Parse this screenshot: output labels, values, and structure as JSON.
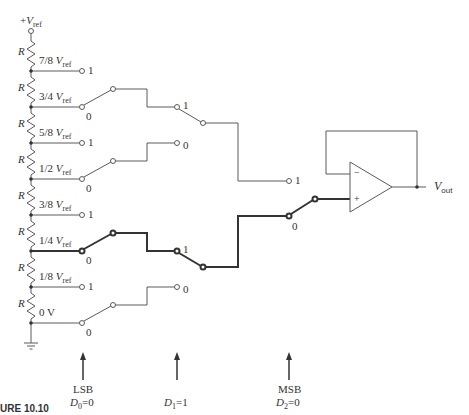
{
  "figure": {
    "caption": "URE 10.10",
    "supply_label": {
      "prefix": "+",
      "symbol": "V",
      "sub": "ref"
    },
    "resistor_label": "R",
    "taps": [
      {
        "fraction": "7/8",
        "symbol": "V",
        "sub": "ref",
        "switch_input": "1"
      },
      {
        "fraction": "3/4",
        "symbol": "V",
        "sub": "ref",
        "switch_input": "0"
      },
      {
        "fraction": "5/8",
        "symbol": "V",
        "sub": "ref",
        "switch_input": "1"
      },
      {
        "fraction": "1/2",
        "symbol": "V",
        "sub": "ref",
        "switch_input": "0"
      },
      {
        "fraction": "3/8",
        "symbol": "V",
        "sub": "ref",
        "switch_input": "1"
      },
      {
        "fraction": "1/4",
        "symbol": "V",
        "sub": "ref",
        "switch_input": "0"
      },
      {
        "fraction": "1/8",
        "symbol": "V",
        "sub": "ref",
        "switch_input": "1"
      },
      {
        "fraction": "0 V",
        "symbol": "",
        "sub": "",
        "switch_input": "0"
      }
    ],
    "stage2_inputs": [
      "1",
      "0",
      "1",
      "0"
    ],
    "stage3_inputs": [
      "1",
      "0"
    ],
    "opamp": {
      "minus": "−",
      "plus": "+"
    },
    "output_label": {
      "symbol": "V",
      "sub": "out"
    },
    "bits": [
      {
        "role": "LSB",
        "name": "D",
        "index": "0",
        "value": "=0"
      },
      {
        "role": "",
        "name": "D",
        "index": "1",
        "value": "=1"
      },
      {
        "role": "MSB",
        "name": "D",
        "index": "2",
        "value": "=0"
      }
    ],
    "selected_path": "1/4 Vref → Vout (D2D1D0 = 010)",
    "colors": {
      "line": "#555555",
      "active_path": "#333333",
      "background": "#ffffff"
    }
  }
}
